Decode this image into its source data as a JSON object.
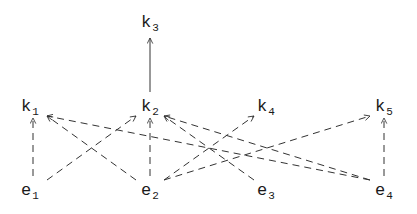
{
  "diagram": {
    "type": "directed-graph",
    "nodes": [
      {
        "id": "k3",
        "base": "k",
        "sub": "3",
        "x": 150,
        "y": 28
      },
      {
        "id": "k1",
        "base": "k",
        "sub": "1",
        "x": 33,
        "y": 108
      },
      {
        "id": "k2",
        "base": "k",
        "sub": "2",
        "x": 150,
        "y": 108
      },
      {
        "id": "k4",
        "base": "k",
        "sub": "4",
        "x": 268,
        "y": 108
      },
      {
        "id": "k5",
        "base": "k",
        "sub": "5",
        "x": 384,
        "y": 108
      },
      {
        "id": "e1",
        "base": "e",
        "sub": "1",
        "x": 33,
        "y": 192
      },
      {
        "id": "e2",
        "base": "e",
        "sub": "2",
        "x": 150,
        "y": 192
      },
      {
        "id": "e3",
        "base": "e",
        "sub": "3",
        "x": 268,
        "y": 192
      },
      {
        "id": "e4",
        "base": "e",
        "sub": "4",
        "x": 384,
        "y": 192
      }
    ],
    "edges": [
      {
        "from": "k2",
        "to": "k3",
        "style": "solid"
      },
      {
        "from": "e1",
        "to": "k1",
        "style": "dashed"
      },
      {
        "from": "e1",
        "to": "k2",
        "style": "dashed"
      },
      {
        "from": "e2",
        "to": "k1",
        "style": "dashed"
      },
      {
        "from": "e2",
        "to": "k2",
        "style": "dashed"
      },
      {
        "from": "e2",
        "to": "k4",
        "style": "dashed"
      },
      {
        "from": "e2",
        "to": "k5",
        "style": "dashed"
      },
      {
        "from": "e3",
        "to": "k2",
        "style": "dashed"
      },
      {
        "from": "e4",
        "to": "k1",
        "style": "dashed"
      },
      {
        "from": "e4",
        "to": "k2",
        "style": "dashed"
      },
      {
        "from": "e4",
        "to": "k5",
        "style": "dashed"
      }
    ]
  },
  "labels": {
    "k3": {
      "base": "k",
      "sub": "3"
    },
    "k1": {
      "base": "k",
      "sub": "1"
    },
    "k2": {
      "base": "k",
      "sub": "2"
    },
    "k4": {
      "base": "k",
      "sub": "4"
    },
    "k5": {
      "base": "k",
      "sub": "5"
    },
    "e1": {
      "base": "e",
      "sub": "1"
    },
    "e2": {
      "base": "e",
      "sub": "2"
    },
    "e3": {
      "base": "e",
      "sub": "3"
    },
    "e4": {
      "base": "e",
      "sub": "4"
    }
  }
}
